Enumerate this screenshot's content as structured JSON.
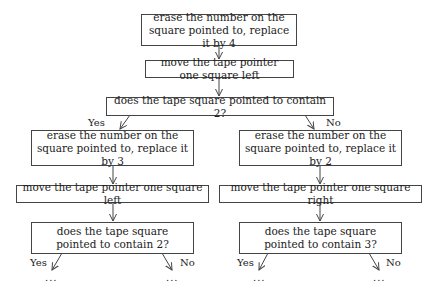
{
  "flowchart": {
    "start": {
      "action1": "erase the number on the square pointed to, replace it by 4",
      "action2": "move the tape pointer one square left",
      "decision": "does the tape square pointed to contain 2?"
    },
    "yes_branch": {
      "edge_label": "Yes",
      "action1": "erase the number on the square pointed to, replace it by 3",
      "action2": "move the tape pointer one square left",
      "decision": "does the tape square pointed to contain 2?",
      "yes_label": "Yes",
      "no_label": "No",
      "continuation": "..."
    },
    "no_branch": {
      "edge_label": "No",
      "action1": "erase the number on the square pointed to, replace it by 2",
      "action2": "move the tape pointer one square right",
      "decision": "does the tape square pointed to contain 3?",
      "yes_label": "Yes",
      "no_label": "No",
      "continuation": "..."
    }
  }
}
